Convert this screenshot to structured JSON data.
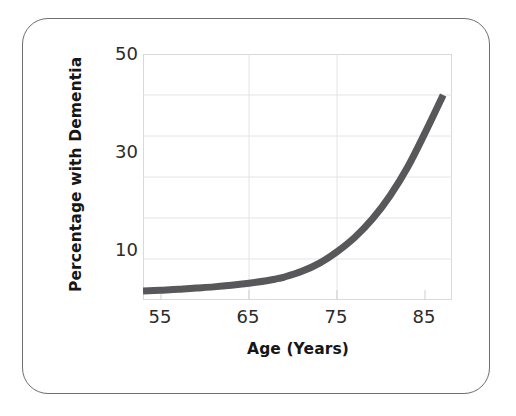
{
  "figure": {
    "name": "dementia-prevalence-by-age-chart",
    "background_color": "#ffffff",
    "frame_color": "#6f6f6f"
  },
  "chart_data": {
    "type": "line",
    "title": "",
    "xlabel": "Age (Years)",
    "ylabel": "Percentage with Dementia",
    "xlim": [
      50,
      85
    ],
    "ylim": [
      0,
      60
    ],
    "xticks": [
      55,
      65,
      75,
      85
    ],
    "xtick_labels": [
      "55",
      "65",
      "75",
      "85"
    ],
    "yticks": [
      10,
      30,
      50
    ],
    "ytick_labels": [
      "10",
      "30",
      "50"
    ],
    "gridlines_y": [
      10,
      20,
      30,
      40,
      50
    ],
    "gridlines_x": [
      65,
      75
    ],
    "grid": true,
    "grid_color": "#e2e2e2",
    "legend": "none",
    "series": [
      {
        "name": "Percentage with Dementia",
        "color": "#58585a",
        "line_width": 7,
        "x": [
          50,
          52,
          54,
          56,
          58,
          60,
          62,
          64,
          65,
          66,
          68,
          70,
          72,
          74,
          76,
          78,
          80,
          82,
          84
        ],
        "y": [
          2.2,
          2.4,
          2.6,
          2.9,
          3.2,
          3.6,
          4.1,
          4.7,
          5.1,
          5.6,
          7.0,
          9.0,
          11.8,
          15.3,
          19.8,
          25.5,
          32.5,
          41.0,
          50.0
        ]
      }
    ]
  },
  "axis_titles": {
    "x": "Age (Years)",
    "y": "Percentage with Dementia"
  }
}
